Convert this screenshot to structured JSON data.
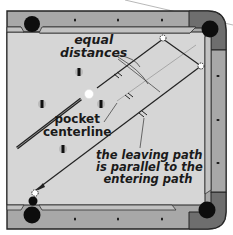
{
  "diagram": {
    "colors": {
      "rail": "#a8a8a8",
      "rail_corner": "#6e6e6e",
      "cloth": "#d6d6d6",
      "cushion_outline": "#333333",
      "pocket": "#0d0d0d",
      "line": "#222222",
      "guide_line": "#9a9a9a"
    },
    "labels": {
      "equal_distances": [
        "equal",
        "distances"
      ],
      "pocket_centerline": [
        "pocket",
        "centerline"
      ],
      "leaving_path": [
        "the leaving path",
        "is parallel to the",
        "entering path"
      ]
    },
    "balls": [
      {
        "type": "cue",
        "x": 89,
        "y": 94
      },
      {
        "type": "striped",
        "x": 79,
        "y": 72
      },
      {
        "type": "striped",
        "x": 42,
        "y": 104
      },
      {
        "type": "striped",
        "x": 101,
        "y": 104
      },
      {
        "type": "striped",
        "x": 63,
        "y": 149
      },
      {
        "type": "object",
        "x": 33,
        "y": 199
      }
    ],
    "pockets": [
      {
        "position": "top-left"
      },
      {
        "position": "top-right"
      },
      {
        "position": "bottom-left"
      },
      {
        "position": "bottom-right"
      }
    ],
    "diamonds": {
      "top": 3,
      "bottom": 3,
      "right": 3
    }
  }
}
